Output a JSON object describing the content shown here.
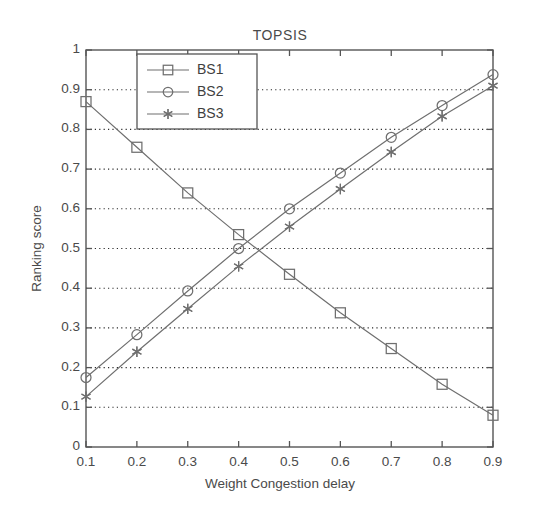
{
  "chart_data": {
    "type": "line",
    "title": "TOPSIS",
    "xlabel": "Weight Congestion delay",
    "ylabel": "Ranking score",
    "x": [
      0.1,
      0.2,
      0.3,
      0.4,
      0.5,
      0.6,
      0.7,
      0.8,
      0.9
    ],
    "xlim": [
      0.1,
      0.9
    ],
    "ylim": [
      0,
      1
    ],
    "xticks": [
      "0.1",
      "0.2",
      "0.3",
      "0.4",
      "0.5",
      "0.6",
      "0.7",
      "0.8",
      "0.9"
    ],
    "yticks": [
      "0",
      "0.1",
      "0.2",
      "0.3",
      "0.4",
      "0.5",
      "0.6",
      "0.7",
      "0.8",
      "0.9",
      "1"
    ],
    "grid": "horizontal-dotted",
    "legend_position": "top-left-inside",
    "series": [
      {
        "name": "BS1",
        "marker": "square",
        "color": "#6f6f6f",
        "values": [
          0.87,
          0.755,
          0.64,
          0.535,
          0.435,
          0.338,
          0.248,
          0.158,
          0.08
        ]
      },
      {
        "name": "BS2",
        "marker": "circle",
        "color": "#6f6f6f",
        "values": [
          0.175,
          0.283,
          0.393,
          0.5,
          0.6,
          0.69,
          0.78,
          0.86,
          0.938
        ]
      },
      {
        "name": "BS3",
        "marker": "star",
        "color": "#6f6f6f",
        "values": [
          0.127,
          0.24,
          0.348,
          0.455,
          0.555,
          0.65,
          0.743,
          0.833,
          0.91
        ]
      }
    ]
  },
  "axes": {
    "frame_color": "#555555",
    "grid_color": "#2b2b2b"
  },
  "legend": {
    "entries": [
      {
        "label": "BS1"
      },
      {
        "label": "BS2"
      },
      {
        "label": "BS3"
      }
    ]
  }
}
